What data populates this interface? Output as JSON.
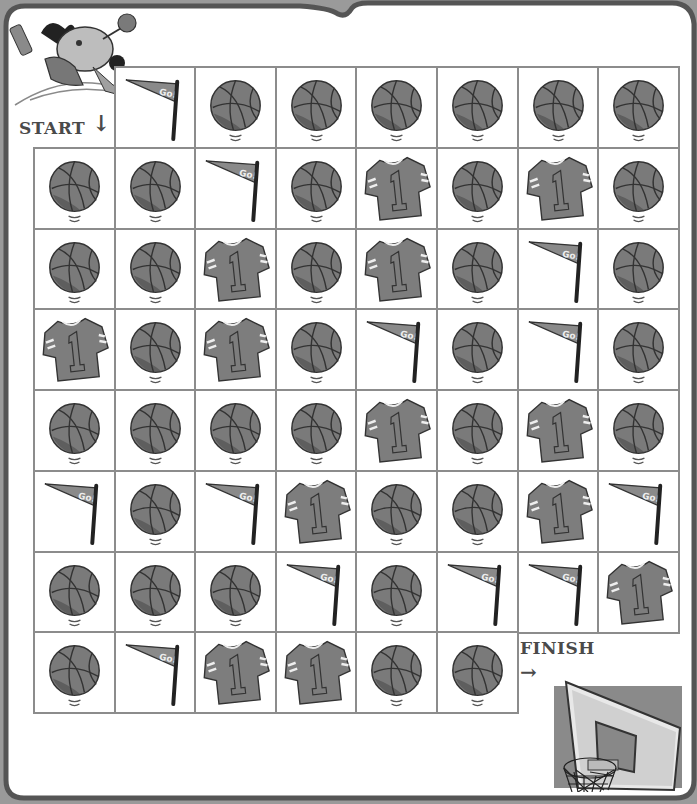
{
  "puzzle": {
    "start_label": "START",
    "start_arrow": "↓",
    "finish_label": "FINISH",
    "finish_arrow": "→",
    "pennant_text": "Go!",
    "jersey_number": "1"
  },
  "colors": {
    "background_outer": "#9a9a9a",
    "frame": "#555555",
    "paper": "#ffffff",
    "grid_line": "#8c8c8c",
    "ball": "#7a7a7a",
    "ball_dark": "#5e5e5e",
    "jersey": "#7d7d7d",
    "flag": "#8a8a8a",
    "label_text": "#4a4a4a"
  },
  "grid": {
    "origin_x": 33,
    "origin_y": 66,
    "cell_w": 80.6,
    "cell_h": 80.75,
    "rows": [
      [
        "start",
        "flag",
        "ball",
        "ball",
        "ball",
        "ball",
        "ball",
        "ball"
      ],
      [
        "ball",
        "ball",
        "flag",
        "ball",
        "jersey",
        "ball",
        "jersey",
        "ball"
      ],
      [
        "ball",
        "ball",
        "jersey",
        "ball",
        "jersey",
        "ball",
        "flag",
        "ball"
      ],
      [
        "jersey",
        "ball",
        "jersey",
        "ball",
        "flag",
        "ball",
        "flag",
        "ball"
      ],
      [
        "ball",
        "ball",
        "ball",
        "ball",
        "jersey",
        "ball",
        "jersey",
        "ball"
      ],
      [
        "flag",
        "ball",
        "flag",
        "jersey",
        "ball",
        "ball",
        "jersey",
        "flag"
      ],
      [
        "ball",
        "ball",
        "ball",
        "flag",
        "ball",
        "flag",
        "flag",
        "jersey"
      ],
      [
        "ball",
        "flag",
        "jersey",
        "jersey",
        "ball",
        "ball",
        "finish",
        "finish"
      ]
    ]
  }
}
